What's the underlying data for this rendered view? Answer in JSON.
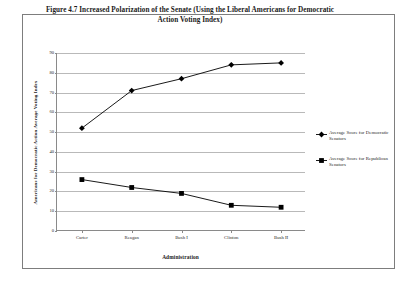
{
  "figure": {
    "title": "Figure 4.7 Increased Polarization of the Senate (Using the Liberal Americans for Democratic Action Voting Index)"
  },
  "chart_data": {
    "type": "line",
    "title": "Figure 4.7 Increased Polarization of the Senate (Using the Liberal Americans for Democratic Action Voting Index)",
    "xlabel": "Administration",
    "ylabel": "Americans for Democratic Action Average Voting Index",
    "categories": [
      "Carter",
      "Reagan",
      "Bush I",
      "Clinton",
      "Bush II"
    ],
    "series": [
      {
        "name": "Average Score for Democratic Senators",
        "values": [
          52,
          71,
          77,
          84,
          85
        ],
        "marker": "diamond",
        "color": "#000000"
      },
      {
        "name": "Average Score for Republican Senators",
        "values": [
          26,
          22,
          19,
          13,
          12
        ],
        "marker": "square",
        "color": "#000000"
      }
    ],
    "ylim": [
      0,
      90
    ],
    "yticks": [
      0,
      10,
      20,
      30,
      40,
      50,
      60,
      70,
      80,
      90
    ],
    "ytick_labels": [
      "0",
      "10",
      "20",
      "30",
      "40",
      "50",
      "60",
      "70",
      "80",
      "90"
    ],
    "grid": true,
    "legend_position": "right"
  },
  "legend": {
    "entries": [
      {
        "label": "Average Score for Democratic Senators",
        "marker": "diamond"
      },
      {
        "label": "Average Score for Republican Senators",
        "marker": "square"
      }
    ]
  }
}
